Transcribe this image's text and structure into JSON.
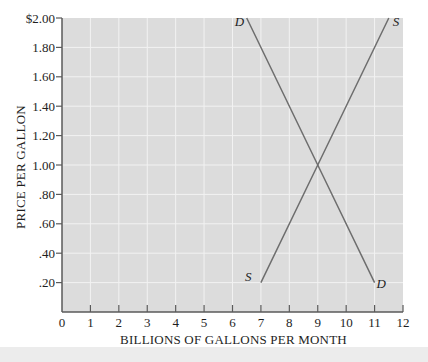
{
  "chart_data": {
    "type": "line",
    "title": "",
    "xlabel": "BILLIONS OF GALLONS PER MONTH",
    "ylabel": "PRICE PER GALLON",
    "xlim": [
      0,
      12
    ],
    "ylim": [
      0,
      2.0
    ],
    "x_ticks": [
      "0",
      "1",
      "2",
      "3",
      "4",
      "5",
      "6",
      "7",
      "8",
      "9",
      "10",
      "11",
      "12"
    ],
    "y_ticks": [
      {
        "value": 0.2,
        "label": ".20"
      },
      {
        "value": 0.4,
        "label": ".40"
      },
      {
        "value": 0.6,
        "label": ".60"
      },
      {
        "value": 0.8,
        "label": ".80"
      },
      {
        "value": 1.0,
        "label": "1.00"
      },
      {
        "value": 1.2,
        "label": "1.20"
      },
      {
        "value": 1.4,
        "label": "1.40"
      },
      {
        "value": 1.6,
        "label": "1.60"
      },
      {
        "value": 1.8,
        "label": "1.80"
      },
      {
        "value": 2.0,
        "label": "$2.00"
      }
    ],
    "grid": true,
    "legend": "none (curves labeled inline)",
    "series": [
      {
        "name": "D",
        "label": "Demand",
        "points": [
          {
            "x": 6.5,
            "y": 2.0
          },
          {
            "x": 9,
            "y": 1.0
          },
          {
            "x": 11,
            "y": 0.2
          }
        ],
        "end_labels": [
          "D",
          "D"
        ]
      },
      {
        "name": "S",
        "label": "Supply",
        "points": [
          {
            "x": 7,
            "y": 0.2
          },
          {
            "x": 9,
            "y": 1.0
          },
          {
            "x": 11.5,
            "y": 2.0
          }
        ],
        "end_labels": [
          "S",
          "S"
        ]
      }
    ],
    "equilibrium": {
      "x": 9,
      "y": 1.0
    }
  },
  "colors": {
    "plot_background": "#dcdcdc",
    "grid": "#f2f2f2",
    "axis": "#5a5a5a",
    "line": "#6e6e6e",
    "text": "#1e1e1e",
    "bottom_band": "#ececec"
  }
}
